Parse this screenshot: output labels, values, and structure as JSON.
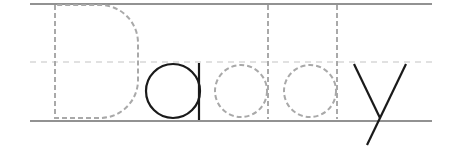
{
  "worksheet": {
    "word": "Daddy",
    "letters": [
      {
        "char": "D",
        "style": "traced"
      },
      {
        "char": "a",
        "style": "solid"
      },
      {
        "char": "d",
        "style": "traced"
      },
      {
        "char": "d",
        "style": "traced"
      },
      {
        "char": "y",
        "style": "solid"
      }
    ]
  },
  "colors": {
    "guide_line": "#6e6e6e",
    "mid_line": "#c4c4c4",
    "trace": "#a9a9a9",
    "solid": "#1a1a1a",
    "background": "#ffffff"
  }
}
